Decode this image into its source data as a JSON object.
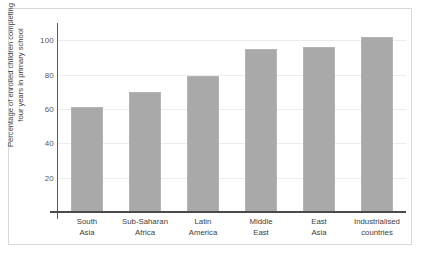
{
  "chart_data": {
    "type": "bar",
    "title": "",
    "subtitle": "",
    "xlabel": "",
    "ylabel_lines": [
      "Percentage of enrolled children completing",
      "four years in primary school"
    ],
    "ylabel": "Percentage of enrolled children completing four years in primary school",
    "categories": [
      "South Asia",
      "Sub-Saharan Africa",
      "Latin America",
      "Middle East",
      "East Asia",
      "Industrialised countries"
    ],
    "category_lines": [
      [
        "South",
        "Asia"
      ],
      [
        "Sub-Saharan",
        "Africa"
      ],
      [
        "Latin",
        "America"
      ],
      [
        "Middle",
        "East"
      ],
      [
        "East",
        "Asia"
      ],
      [
        "Industrialised",
        "countries"
      ]
    ],
    "values": [
      61,
      70,
      79,
      95,
      96,
      102
    ],
    "ylim": [
      0,
      110
    ],
    "yticks": [
      20,
      40,
      60,
      80,
      100
    ],
    "ytick_labels": [
      "20",
      "40",
      "60",
      "80",
      "100"
    ],
    "grid": true,
    "legend": false,
    "legend_position": "none",
    "colors": {
      "bar_fill": "#a9a9a9",
      "bar_edge": "#b4b4b4",
      "gridline": "#ececec",
      "axis": "#4a4a4a",
      "text": "#3e3d40",
      "frame": "#d9d9d9",
      "background": "#ffffff"
    }
  }
}
